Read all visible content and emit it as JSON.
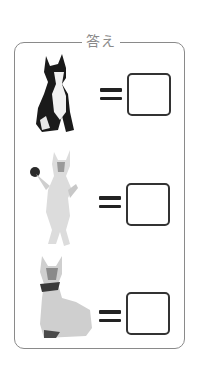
{
  "panel": {
    "title": "答え",
    "frame_color": "#8a8a8a"
  },
  "rows": [
    {
      "image": "cat-sitting-black-white-icon",
      "operator": "=",
      "answer": ""
    },
    {
      "image": "cat-standing-dancing-icon",
      "operator": "=",
      "answer": ""
    },
    {
      "image": "cat-sitting-siamese-collar-icon",
      "operator": "=",
      "answer": ""
    }
  ]
}
